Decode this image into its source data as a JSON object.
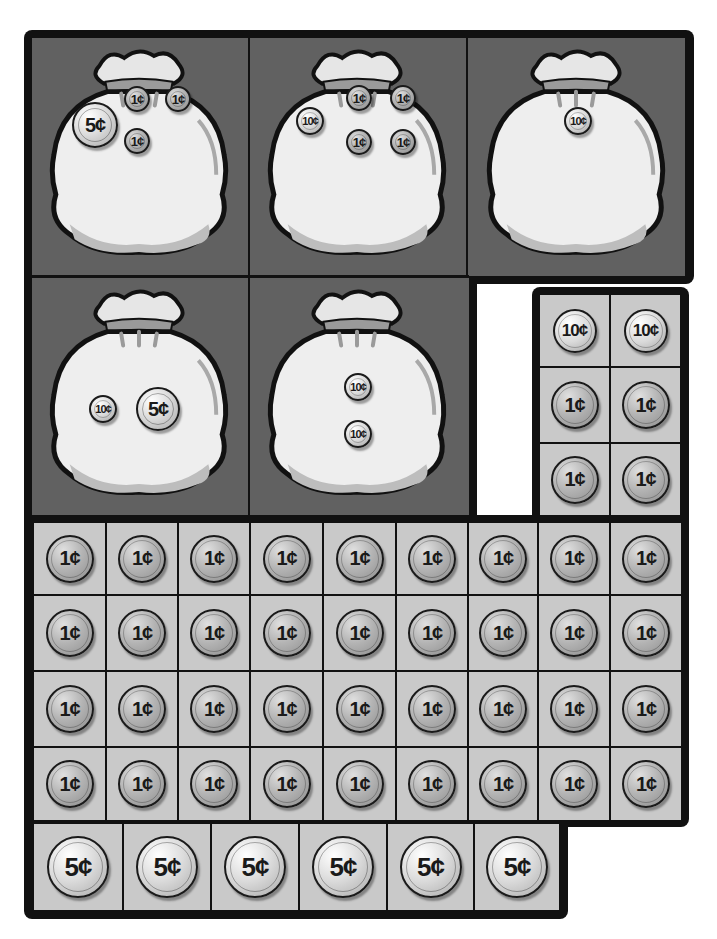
{
  "colors": {
    "frame": "#111111",
    "bag_panel": "#616161",
    "coin_cell": "#c9c9c9",
    "bag_fill": "#eeeeee"
  },
  "bags": [
    {
      "id": 1,
      "coins": [
        {
          "label": "5¢",
          "type": "nickel"
        },
        {
          "label": "1¢",
          "type": "penny"
        },
        {
          "label": "1¢",
          "type": "penny"
        },
        {
          "label": "1¢",
          "type": "penny"
        }
      ]
    },
    {
      "id": 2,
      "coins": [
        {
          "label": "10¢",
          "type": "dime"
        },
        {
          "label": "1¢",
          "type": "penny"
        },
        {
          "label": "1¢",
          "type": "penny"
        },
        {
          "label": "1¢",
          "type": "penny"
        },
        {
          "label": "1¢",
          "type": "penny"
        }
      ]
    },
    {
      "id": 3,
      "coins": [
        {
          "label": "10¢",
          "type": "dime"
        }
      ]
    },
    {
      "id": 4,
      "coins": [
        {
          "label": "10¢",
          "type": "dime"
        },
        {
          "label": "5¢",
          "type": "nickel"
        }
      ]
    },
    {
      "id": 5,
      "coins": [
        {
          "label": "10¢",
          "type": "dime"
        },
        {
          "label": "10¢",
          "type": "dime"
        }
      ]
    }
  ],
  "strip": {
    "rows": [
      [
        "10¢",
        "10¢"
      ],
      [
        "1¢",
        "1¢"
      ],
      [
        "1¢",
        "1¢"
      ]
    ]
  },
  "penny_grid": {
    "rows": [
      [
        "1¢",
        "1¢",
        "1¢",
        "1¢",
        "1¢",
        "1¢",
        "1¢",
        "1¢",
        "1¢"
      ],
      [
        "1¢",
        "1¢",
        "1¢",
        "1¢",
        "1¢",
        "1¢",
        "1¢",
        "1¢",
        "1¢"
      ],
      [
        "1¢",
        "1¢",
        "1¢",
        "1¢",
        "1¢",
        "1¢",
        "1¢",
        "1¢",
        "1¢"
      ],
      [
        "1¢",
        "1¢",
        "1¢",
        "1¢",
        "1¢",
        "1¢",
        "1¢",
        "1¢",
        "1¢"
      ]
    ]
  },
  "nickel_row": [
    "5¢",
    "5¢",
    "5¢",
    "5¢",
    "5¢",
    "5¢"
  ]
}
